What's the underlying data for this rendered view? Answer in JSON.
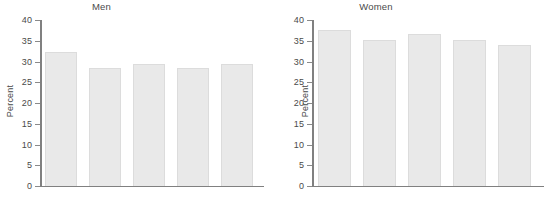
{
  "chart_data": [
    {
      "type": "bar",
      "title": "Men",
      "xlabel": "",
      "ylabel": "Percent",
      "categories": [
        "1997",
        "2000",
        "2008",
        "2010",
        "2012"
      ],
      "values": [
        32.2,
        28.4,
        29.4,
        28.4,
        29.5
      ],
      "ylim": [
        0,
        40
      ],
      "yticks": [
        0,
        5,
        10,
        15,
        20,
        25,
        30,
        35,
        40
      ],
      "ytick_labels": [
        "0",
        "5",
        "10",
        "15",
        "20",
        "25",
        "30",
        "35",
        "40"
      ],
      "grid": false,
      "legend": "none",
      "bar_color": "#e9e9e9",
      "bar_edge_color": "#dcdcdc",
      "axis_color": "#808080"
    },
    {
      "type": "bar",
      "title": "Women",
      "xlabel": "",
      "ylabel": "Percent",
      "categories": [
        "1997",
        "2000",
        "2008",
        "2010",
        "2012"
      ],
      "values": [
        37.6,
        35.2,
        36.6,
        35.3,
        34.0
      ],
      "ylim": [
        0,
        40
      ],
      "yticks": [
        0,
        5,
        10,
        15,
        20,
        25,
        30,
        35,
        40
      ],
      "ytick_labels": [
        "0",
        "5",
        "10",
        "15",
        "20",
        "25",
        "30",
        "35",
        "40"
      ],
      "grid": false,
      "legend": "none",
      "bar_color": "#e9e9e9",
      "bar_edge_color": "#dcdcdc",
      "axis_color": "#808080"
    }
  ],
  "panels": {
    "men": {
      "title": "Men",
      "ylabel": "Percent",
      "ytick_labels": [
        "40",
        "35",
        "30",
        "25",
        "20",
        "15",
        "10",
        "5",
        "0"
      ],
      "categories": [
        "1997",
        "2000",
        "2008",
        "2010",
        "2012"
      ]
    },
    "women": {
      "title": "Women",
      "ylabel": "Percent",
      "ytick_labels": [
        "40",
        "35",
        "30",
        "25",
        "20",
        "15",
        "10",
        "5",
        "0"
      ],
      "categories": [
        "1997",
        "2000",
        "2008",
        "2010",
        "2012"
      ]
    }
  }
}
